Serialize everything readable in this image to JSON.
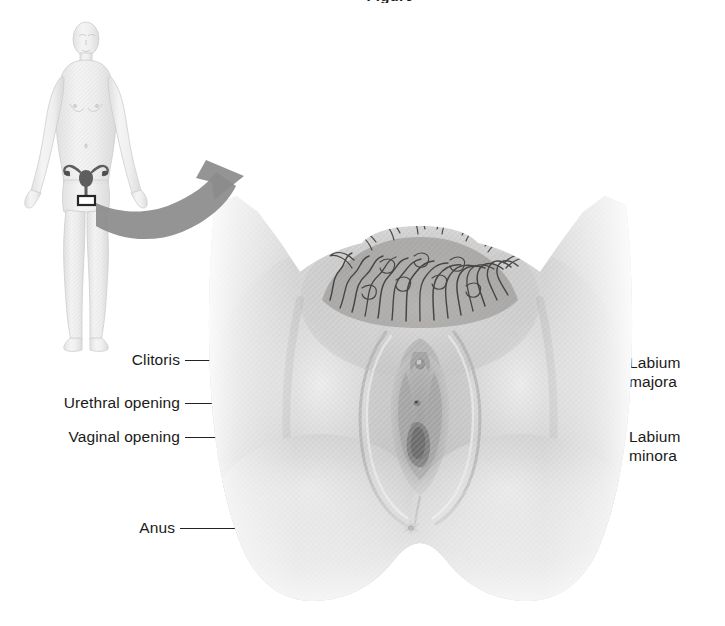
{
  "figure": {
    "title_fragment": "Figure",
    "background_color": "#ffffff",
    "text_color": "#1a1a1a",
    "leader_color": "#222222",
    "arrow_color": "#808080",
    "skin_tone_light": "#f2f2f2",
    "skin_tone_mid": "#c9c9c9",
    "skin_tone_dark": "#9a9a9a",
    "hair_color": "#4a4a4a",
    "body_figure_color": "#e8e8e8",
    "organ_color": "#5a5a5a"
  },
  "labels_left": [
    {
      "text": "Clitoris",
      "line_from_x": 185,
      "line_to_x": 401,
      "line_y": 360,
      "has_dot": false
    },
    {
      "text": "Urethral opening",
      "line_from_x": 185,
      "line_to_x": 403,
      "line_y": 403,
      "has_dot": true
    },
    {
      "text": "Vaginal opening",
      "line_from_x": 185,
      "line_to_x": 400,
      "line_y": 437,
      "has_dot": false
    },
    {
      "text": "Anus",
      "line_from_x": 180,
      "line_to_x": 408,
      "line_y": 528,
      "has_dot": true
    }
  ],
  "labels_right": [
    {
      "line1": "Labium",
      "line2": "majora",
      "line_from_x": 446,
      "line_to_x": 620,
      "line_y": 363
    },
    {
      "line1": "Labium",
      "line2": "minora",
      "line_from_x": 425,
      "line_to_x": 620,
      "line_y": 437
    }
  ],
  "body_figure": {
    "description": "full-body anterior view of a female figure, line-shaded in pale gray",
    "organ_name": "uterus-and-ovaries",
    "marker_name": "genital-region-marker"
  },
  "main_illustration": {
    "description": "close-up anterior view of external female genitalia (vulva), grayscale medical illustration",
    "features": [
      "pubic-hair",
      "mons-pubis",
      "labium-majora",
      "labium-minora",
      "clitoris",
      "urethral-opening",
      "vaginal-opening",
      "perineum",
      "anus"
    ]
  },
  "callout_arrow": {
    "name": "magnification-arrow",
    "description": "thick curved gray arrow pointing from the body figure's pelvis to the enlarged illustration"
  }
}
